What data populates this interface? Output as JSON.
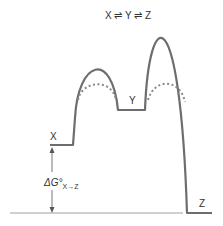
{
  "diagram": {
    "title": "X ⇌ Y ⇌ Z",
    "states": {
      "x_label": "X",
      "y_label": "Y",
      "z_label": "Z"
    },
    "delta_g": {
      "main": "ΔG°",
      "subscript": "X→Z"
    },
    "colors": {
      "curve": "#6d6d6d",
      "dotted": "#8a8a8a",
      "baseline": "#9a9a9a",
      "text": "#333333"
    }
  }
}
